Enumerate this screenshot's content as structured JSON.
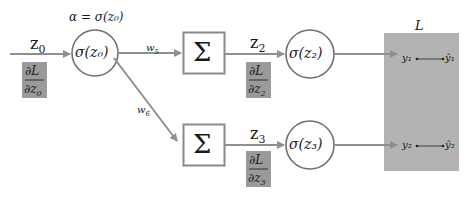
{
  "colors": {
    "line": "#8f8f8f",
    "node_stroke": "#707070",
    "box_stroke": "#8a8a8a",
    "gradient_box_fill": "#9a9a9a",
    "loss_box_fill": "#b3b3b3",
    "text": "#1a1a1a"
  },
  "input": {
    "label": "z",
    "subscript": "0",
    "gradient": {
      "num": "∂L",
      "den": "∂z",
      "den_sub": "0"
    }
  },
  "activation_node_0": {
    "annotation": "α = σ(z₀)",
    "label": "σ(z₀)"
  },
  "edges": {
    "w5": {
      "label": "w",
      "subscript": "5"
    },
    "w6": {
      "label": "w",
      "subscript": "6"
    }
  },
  "sum_nodes": [
    {
      "symbol": "Σ"
    },
    {
      "symbol": "Σ"
    }
  ],
  "outputs": [
    {
      "z_label": "z",
      "z_sub": "2",
      "gradient": {
        "num": "∂L",
        "den": "∂z",
        "den_sub": "2"
      },
      "activation": "σ(z₂)",
      "y": "y₁",
      "y_hat": "ŷ₁"
    },
    {
      "z_label": "z",
      "z_sub": "3",
      "gradient": {
        "num": "∂L",
        "den": "∂z",
        "den_sub": "3"
      },
      "activation": "σ(z₃)",
      "y": "y₂",
      "y_hat": "ŷ₂"
    }
  ],
  "loss": {
    "label": "L"
  }
}
